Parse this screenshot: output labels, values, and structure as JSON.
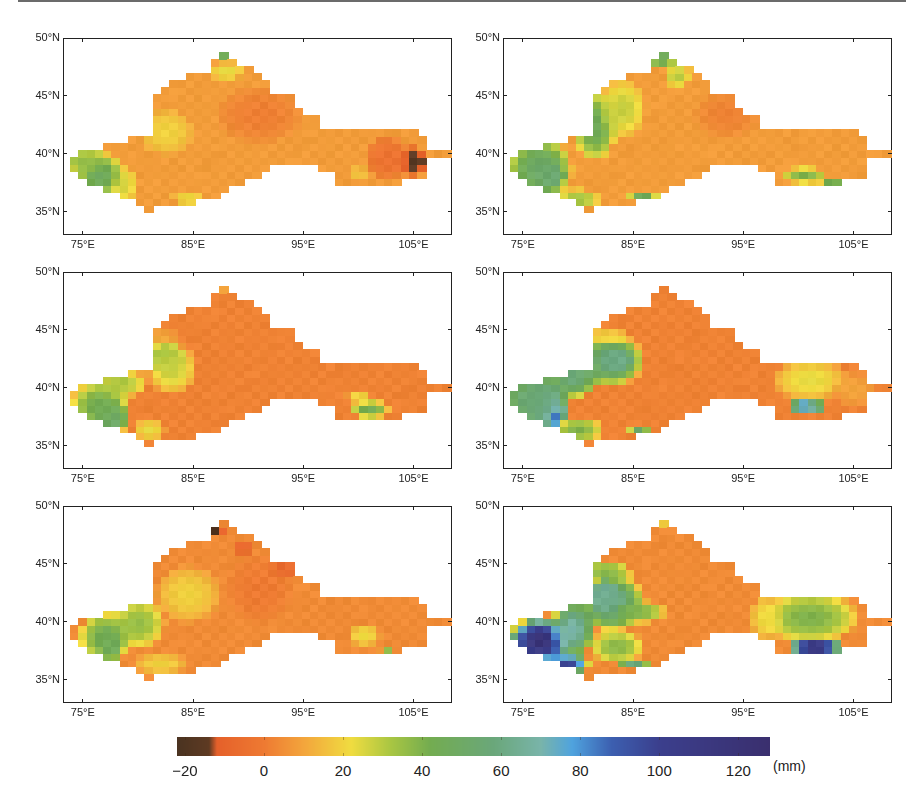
{
  "chart_data": {
    "type": "heatmap",
    "title": "",
    "layout": {
      "rows": 3,
      "cols": 2,
      "panels": 6
    },
    "xlabel": "",
    "ylabel": "",
    "x_ticks": [
      "75°E",
      "85°E",
      "95°E",
      "105°E"
    ],
    "x_tick_values": [
      75,
      85,
      95,
      105
    ],
    "y_ticks": [
      "50°N",
      "45°N",
      "40°N",
      "35°N"
    ],
    "y_tick_values": [
      50,
      45,
      40,
      35
    ],
    "xlim": [
      73.2,
      108.5
    ],
    "ylim": [
      33,
      50
    ],
    "grid": false,
    "colorbar": {
      "ticks": [
        -20,
        0,
        20,
        40,
        60,
        80,
        100,
        120
      ],
      "tick_labels": [
        "−20",
        "0",
        "20",
        "40",
        "60",
        "80",
        "100",
        "120"
      ],
      "range": [
        -22,
        128
      ],
      "unit": "(mm)",
      "colors": [
        {
          "v": -22,
          "c": "#4a3321"
        },
        {
          "v": -14,
          "c": "#5e3a22"
        },
        {
          "v": -12,
          "c": "#e5602a"
        },
        {
          "v": 0,
          "c": "#ee7a32"
        },
        {
          "v": 10,
          "c": "#f3a53c"
        },
        {
          "v": 22,
          "c": "#f0dc40"
        },
        {
          "v": 32,
          "c": "#a9c642"
        },
        {
          "v": 42,
          "c": "#73ac50"
        },
        {
          "v": 58,
          "c": "#6aa77a"
        },
        {
          "v": 70,
          "c": "#79b4a9"
        },
        {
          "v": 78,
          "c": "#4fa3de"
        },
        {
          "v": 88,
          "c": "#3c5fb0"
        },
        {
          "v": 100,
          "c": "#3b3f8d"
        },
        {
          "v": 128,
          "c": "#3a2f6e"
        }
      ]
    },
    "panels": [
      {
        "id": "a",
        "position": "top-left",
        "base_value": 8,
        "anomalies": [
          {
            "lon": 76.5,
            "lat": 38.3,
            "rx": 2.2,
            "ry": 2.0,
            "value": 48
          },
          {
            "lon": 75.0,
            "lat": 39.5,
            "rx": 2.0,
            "ry": 1.2,
            "value": 36
          },
          {
            "lon": 78.8,
            "lat": 37.5,
            "rx": 1.0,
            "ry": 1.8,
            "value": 26
          },
          {
            "lon": 82.5,
            "lat": 42.0,
            "rx": 2.5,
            "ry": 2.0,
            "value": 20
          },
          {
            "lon": 84.5,
            "lat": 36.3,
            "rx": 1.5,
            "ry": 0.8,
            "value": 22
          },
          {
            "lon": 87.5,
            "lat": 48.5,
            "rx": 1.3,
            "ry": 0.6,
            "value": 45
          },
          {
            "lon": 88.0,
            "lat": 47.2,
            "rx": 1.6,
            "ry": 0.8,
            "value": 24
          },
          {
            "lon": 91.0,
            "lat": 43.5,
            "rx": 4.0,
            "ry": 2.5,
            "value": 1
          },
          {
            "lon": 104.8,
            "lat": 39.5,
            "rx": 1.8,
            "ry": 1.3,
            "value": -18
          },
          {
            "lon": 102.5,
            "lat": 39.8,
            "rx": 2.0,
            "ry": 2.0,
            "value": -4
          },
          {
            "lon": 100.0,
            "lat": 38.5,
            "rx": 0.8,
            "ry": 0.6,
            "value": 18
          }
        ]
      },
      {
        "id": "b",
        "position": "top-right",
        "base_value": 8,
        "anomalies": [
          {
            "lon": 77.5,
            "lat": 38.3,
            "rx": 1.3,
            "ry": 1.3,
            "value": 74
          },
          {
            "lon": 76.5,
            "lat": 38.8,
            "rx": 3.0,
            "ry": 2.8,
            "value": 52
          },
          {
            "lon": 81.5,
            "lat": 42.5,
            "rx": 2.0,
            "ry": 3.0,
            "value": 46
          },
          {
            "lon": 84.0,
            "lat": 44.0,
            "rx": 2.2,
            "ry": 2.5,
            "value": 28
          },
          {
            "lon": 80.0,
            "lat": 36.2,
            "rx": 2.0,
            "ry": 1.0,
            "value": 34
          },
          {
            "lon": 85.8,
            "lat": 36.5,
            "rx": 1.3,
            "ry": 0.6,
            "value": 48
          },
          {
            "lon": 87.5,
            "lat": 48.3,
            "rx": 1.6,
            "ry": 0.8,
            "value": 48
          },
          {
            "lon": 89.0,
            "lat": 46.8,
            "rx": 1.2,
            "ry": 1.0,
            "value": 30
          },
          {
            "lon": 100.5,
            "lat": 38.3,
            "rx": 2.0,
            "ry": 0.7,
            "value": 40
          },
          {
            "lon": 103.0,
            "lat": 37.5,
            "rx": 1.2,
            "ry": 0.7,
            "value": 46
          },
          {
            "lon": 93.5,
            "lat": 43.5,
            "rx": 3.0,
            "ry": 2.0,
            "value": 2
          }
        ]
      },
      {
        "id": "c",
        "position": "middle-left",
        "base_value": 2,
        "anomalies": [
          {
            "lon": 77.5,
            "lat": 37.8,
            "rx": 0.6,
            "ry": 0.6,
            "value": 92
          },
          {
            "lon": 77.5,
            "lat": 37.5,
            "rx": 1.6,
            "ry": 1.6,
            "value": 66
          },
          {
            "lon": 76.5,
            "lat": 38.5,
            "rx": 2.8,
            "ry": 2.4,
            "value": 44
          },
          {
            "lon": 78.5,
            "lat": 40.5,
            "rx": 2.5,
            "ry": 1.2,
            "value": 32
          },
          {
            "lon": 82.5,
            "lat": 42.8,
            "rx": 1.8,
            "ry": 1.4,
            "value": 42
          },
          {
            "lon": 83.0,
            "lat": 41.8,
            "rx": 2.3,
            "ry": 2.2,
            "value": 28
          },
          {
            "lon": 82.0,
            "lat": 44.5,
            "rx": 2.0,
            "ry": 0.6,
            "value": 12
          },
          {
            "lon": 81.0,
            "lat": 36.5,
            "rx": 1.5,
            "ry": 1.0,
            "value": 24
          },
          {
            "lon": 101.0,
            "lat": 38.3,
            "rx": 1.8,
            "ry": 0.8,
            "value": 44
          },
          {
            "lon": 100.0,
            "lat": 39.3,
            "rx": 1.2,
            "ry": 0.6,
            "value": 22
          },
          {
            "lon": 87.5,
            "lat": 48.6,
            "rx": 0.8,
            "ry": 0.5,
            "value": 10
          }
        ]
      },
      {
        "id": "d",
        "position": "middle-right",
        "base_value": 2,
        "anomalies": [
          {
            "lon": 77.8,
            "lat": 38.0,
            "rx": 1.0,
            "ry": 1.3,
            "value": 115
          },
          {
            "lon": 77.0,
            "lat": 38.7,
            "rx": 2.3,
            "ry": 2.3,
            "value": 76
          },
          {
            "lon": 75.5,
            "lat": 39.2,
            "rx": 3.0,
            "ry": 2.4,
            "value": 56
          },
          {
            "lon": 79.5,
            "lat": 41.0,
            "rx": 2.5,
            "ry": 1.8,
            "value": 58
          },
          {
            "lon": 83.5,
            "lat": 42.5,
            "rx": 1.5,
            "ry": 1.0,
            "value": 88
          },
          {
            "lon": 83.0,
            "lat": 42.5,
            "rx": 3.0,
            "ry": 2.2,
            "value": 60
          },
          {
            "lon": 82.5,
            "lat": 44.5,
            "rx": 2.5,
            "ry": 0.8,
            "value": 20
          },
          {
            "lon": 80.0,
            "lat": 36.5,
            "rx": 2.3,
            "ry": 1.2,
            "value": 40
          },
          {
            "lon": 85.5,
            "lat": 36.5,
            "rx": 1.0,
            "ry": 0.6,
            "value": 52
          },
          {
            "lon": 100.2,
            "lat": 38.6,
            "rx": 0.8,
            "ry": 0.5,
            "value": 112
          },
          {
            "lon": 101.0,
            "lat": 38.5,
            "rx": 1.6,
            "ry": 0.8,
            "value": 72
          },
          {
            "lon": 101.0,
            "lat": 40.8,
            "rx": 3.5,
            "ry": 1.8,
            "value": 24
          },
          {
            "lon": 105.0,
            "lat": 40.0,
            "rx": 2.0,
            "ry": 1.5,
            "value": 10
          }
        ]
      },
      {
        "id": "e",
        "position": "bottom-left",
        "base_value": 4,
        "anomalies": [
          {
            "lon": 77.5,
            "lat": 38.3,
            "rx": 1.2,
            "ry": 1.5,
            "value": 62
          },
          {
            "lon": 77.0,
            "lat": 38.8,
            "rx": 2.5,
            "ry": 2.2,
            "value": 44
          },
          {
            "lon": 80.0,
            "lat": 40.0,
            "rx": 2.5,
            "ry": 2.2,
            "value": 36
          },
          {
            "lon": 84.5,
            "lat": 42.5,
            "rx": 3.0,
            "ry": 2.5,
            "value": 20
          },
          {
            "lon": 82.0,
            "lat": 36.5,
            "rx": 2.5,
            "ry": 1.0,
            "value": 20
          },
          {
            "lon": 86.8,
            "lat": 48.0,
            "rx": 1.2,
            "ry": 0.7,
            "value": -19
          },
          {
            "lon": 89.5,
            "lat": 46.5,
            "rx": 0.8,
            "ry": 0.6,
            "value": -12
          },
          {
            "lon": 93.0,
            "lat": 44.6,
            "rx": 1.2,
            "ry": 0.5,
            "value": -17
          },
          {
            "lon": 91.0,
            "lat": 43.0,
            "rx": 3.0,
            "ry": 3.0,
            "value": 0
          },
          {
            "lon": 100.5,
            "lat": 39.0,
            "rx": 1.5,
            "ry": 1.0,
            "value": 22
          },
          {
            "lon": 102.5,
            "lat": 37.8,
            "rx": 0.6,
            "ry": 0.4,
            "value": 40
          }
        ]
      },
      {
        "id": "f",
        "position": "bottom-right",
        "base_value": 4,
        "anomalies": [
          {
            "lon": 76.5,
            "lat": 38.5,
            "rx": 2.8,
            "ry": 2.0,
            "value": 120
          },
          {
            "lon": 79.0,
            "lat": 36.5,
            "rx": 2.0,
            "ry": 1.0,
            "value": 100
          },
          {
            "lon": 79.5,
            "lat": 39.5,
            "rx": 2.0,
            "ry": 2.5,
            "value": 70
          },
          {
            "lon": 82.5,
            "lat": 42.3,
            "rx": 1.5,
            "ry": 1.5,
            "value": 95
          },
          {
            "lon": 83.0,
            "lat": 41.8,
            "rx": 3.0,
            "ry": 2.5,
            "value": 62
          },
          {
            "lon": 82.5,
            "lat": 44.5,
            "rx": 2.5,
            "ry": 0.8,
            "value": 40
          },
          {
            "lon": 85.5,
            "lat": 41.0,
            "rx": 2.5,
            "ry": 1.0,
            "value": 40
          },
          {
            "lon": 83.5,
            "lat": 38.0,
            "rx": 2.5,
            "ry": 1.5,
            "value": 38
          },
          {
            "lon": 85.0,
            "lat": 36.5,
            "rx": 1.5,
            "ry": 0.6,
            "value": 60
          },
          {
            "lon": 87.5,
            "lat": 48.7,
            "rx": 0.7,
            "ry": 0.4,
            "value": 22
          },
          {
            "lon": 101.5,
            "lat": 38.0,
            "rx": 2.5,
            "ry": 0.8,
            "value": 120
          },
          {
            "lon": 101.0,
            "lat": 40.5,
            "rx": 4.5,
            "ry": 2.2,
            "value": 40
          },
          {
            "lon": 97.0,
            "lat": 40.5,
            "rx": 1.5,
            "ry": 2.0,
            "value": 22
          }
        ]
      }
    ]
  },
  "colorbar_labels": [
    "−20",
    "0",
    "20",
    "40",
    "60",
    "80",
    "100",
    "120"
  ],
  "colorbar_unit": "(mm)",
  "axis": {
    "x_labels": [
      "75°E",
      "85°E",
      "95°E",
      "105°E"
    ],
    "y_labels": [
      "50°N",
      "45°N",
      "40°N",
      "35°N"
    ]
  }
}
